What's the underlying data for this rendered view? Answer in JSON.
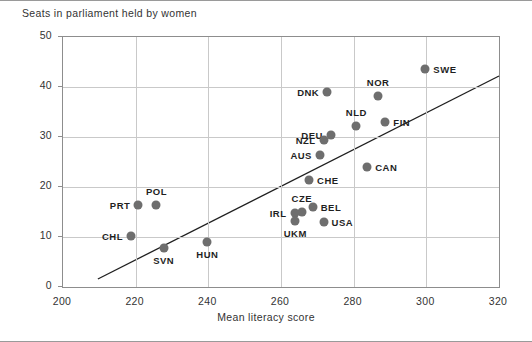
{
  "chart_data": {
    "type": "scatter",
    "title": "Seats in parliament held by women",
    "xlabel": "Mean literacy score",
    "ylabel": "",
    "xlim": [
      200,
      320
    ],
    "ylim": [
      0,
      50
    ],
    "xticks": [
      200,
      220,
      240,
      260,
      280,
      300,
      320
    ],
    "yticks": [
      0,
      10,
      20,
      30,
      40,
      50
    ],
    "grid": true,
    "legend": "none",
    "marker_color": "#6e6e6e",
    "trendline_color": "#1f1f1f",
    "grid_color": "#c9c9c9",
    "axis_color": "#8d8d8d",
    "points": [
      {
        "label": "SWE",
        "x": 300.0,
        "y": 43.4,
        "label_pos": "right"
      },
      {
        "label": "NOR",
        "x": 287.0,
        "y": 38.0,
        "label_pos": "above"
      },
      {
        "label": "DNK",
        "x": 273.0,
        "y": 38.8,
        "label_pos": "left"
      },
      {
        "label": "FIN",
        "x": 289.0,
        "y": 32.8,
        "label_pos": "right"
      },
      {
        "label": "NLD",
        "x": 281.0,
        "y": 32.0,
        "label_pos": "above"
      },
      {
        "label": "DEU",
        "x": 274.0,
        "y": 30.2,
        "label_pos": "left"
      },
      {
        "label": "NZL",
        "x": 272.0,
        "y": 29.2,
        "label_pos": "left"
      },
      {
        "label": "AUS",
        "x": 271.0,
        "y": 26.2,
        "label_pos": "left"
      },
      {
        "label": "CAN",
        "x": 284.0,
        "y": 23.8,
        "label_pos": "right"
      },
      {
        "label": "CHE",
        "x": 268.0,
        "y": 21.2,
        "label_pos": "right"
      },
      {
        "label": "BEL",
        "x": 269.0,
        "y": 15.8,
        "label_pos": "right"
      },
      {
        "label": "CZE",
        "x": 266.0,
        "y": 14.8,
        "label_pos": "above"
      },
      {
        "label": "IRL",
        "x": 264.0,
        "y": 14.6,
        "label_pos": "left"
      },
      {
        "label": "UKM",
        "x": 264.2,
        "y": 13.0,
        "label_pos": "below"
      },
      {
        "label": "USA",
        "x": 272.0,
        "y": 12.8,
        "label_pos": "right"
      },
      {
        "label": "POL",
        "x": 226.0,
        "y": 16.2,
        "label_pos": "above"
      },
      {
        "label": "PRT",
        "x": 221.0,
        "y": 16.2,
        "label_pos": "left"
      },
      {
        "label": "CHL",
        "x": 219.0,
        "y": 10.0,
        "label_pos": "left"
      },
      {
        "label": "SVN",
        "x": 228.0,
        "y": 7.6,
        "label_pos": "below"
      },
      {
        "label": "HUN",
        "x": 240.0,
        "y": 8.8,
        "label_pos": "below"
      }
    ],
    "trendline": {
      "x0": 209.6,
      "y0": 1.6,
      "x1": 320.0,
      "y1": 42.2
    }
  }
}
